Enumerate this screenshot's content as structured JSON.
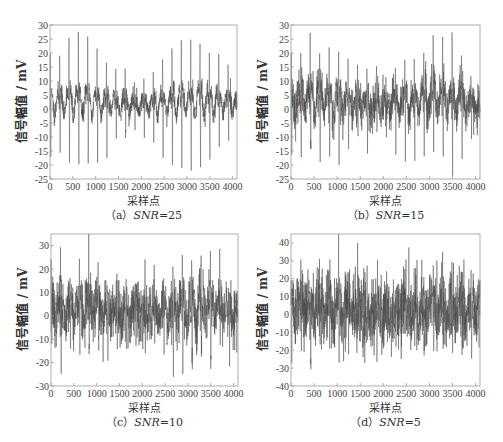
{
  "figure": {
    "ylabel": "信号幅值 / mV",
    "xlabel": "采样点",
    "line_color": "#4a4a4a",
    "axis_color": "#9a9a9a"
  },
  "panels": [
    {
      "id": "a",
      "caption_prefix": "（a）",
      "caption_var": "SNR",
      "caption_value": "=25",
      "box": {
        "left": 50,
        "top": 25,
        "right": 237,
        "bottom": 179
      },
      "ylim": [
        -25,
        30
      ],
      "yticks": [
        -25,
        -20,
        -15,
        -10,
        -5,
        0,
        5,
        10,
        15,
        20,
        25,
        30
      ],
      "noise_amp": 3,
      "seed": 11
    },
    {
      "id": "b",
      "caption_prefix": "（b）",
      "caption_var": "SNR",
      "caption_value": "=15",
      "box": {
        "left": 291,
        "top": 25,
        "right": 480,
        "bottom": 179
      },
      "ylim": [
        -25,
        30
      ],
      "yticks": [
        -25,
        -20,
        -15,
        -10,
        -5,
        0,
        5,
        10,
        15,
        20,
        25,
        30
      ],
      "noise_amp": 6,
      "seed": 23
    },
    {
      "id": "c",
      "caption_prefix": "（c）",
      "caption_var": "SNR",
      "caption_value": "=10",
      "box": {
        "left": 51,
        "top": 234,
        "right": 238,
        "bottom": 386
      },
      "ylim": [
        -30,
        35
      ],
      "yticks": [
        -30,
        -20,
        -10,
        0,
        10,
        20,
        30
      ],
      "noise_amp": 10,
      "seed": 37
    },
    {
      "id": "d",
      "caption_prefix": "（d）",
      "caption_var": "SNR",
      "caption_value": "=5",
      "box": {
        "left": 291,
        "top": 234,
        "right": 480,
        "bottom": 386
      },
      "ylim": [
        -40,
        45
      ],
      "yticks": [
        -40,
        -30,
        -20,
        -10,
        0,
        10,
        20,
        30,
        40
      ],
      "noise_amp": 17,
      "seed": 51
    }
  ],
  "chart_data": [
    {
      "type": "line",
      "title": "(a) SNR=25",
      "xlabel": "采样点",
      "ylabel": "信号幅值 / mV",
      "xlim": [
        0,
        4096
      ],
      "ylim": [
        -25,
        30
      ],
      "xticks": [
        0,
        500,
        1000,
        1500,
        2000,
        2500,
        3000,
        3500,
        4000
      ],
      "yticks": [
        -25,
        -20,
        -15,
        -10,
        -5,
        0,
        5,
        10,
        15,
        20,
        25,
        30
      ],
      "grid": false,
      "series": [
        {
          "name": "noisy ECG-like signal",
          "approx_range": [
            -21,
            27
          ],
          "peak_spacing_samples": 200
        }
      ]
    },
    {
      "type": "line",
      "title": "(b) SNR=15",
      "xlabel": "采样点",
      "ylabel": "信号幅值 / mV",
      "xlim": [
        0,
        4096
      ],
      "ylim": [
        -25,
        30
      ],
      "xticks": [
        0,
        500,
        1000,
        1500,
        2000,
        2500,
        3000,
        3500,
        4000
      ],
      "yticks": [
        -25,
        -20,
        -15,
        -10,
        -5,
        0,
        5,
        10,
        15,
        20,
        25,
        30
      ],
      "grid": false,
      "series": [
        {
          "name": "noisy ECG-like signal",
          "approx_range": [
            -22,
            28
          ],
          "peak_spacing_samples": 200
        }
      ]
    },
    {
      "type": "line",
      "title": "(c) SNR=10",
      "xlabel": "采样点",
      "ylabel": "信号幅值 / mV",
      "xlim": [
        0,
        4096
      ],
      "ylim": [
        -30,
        35
      ],
      "xticks": [
        0,
        500,
        1000,
        1500,
        2000,
        2500,
        3000,
        3500,
        4000
      ],
      "yticks": [
        -30,
        -20,
        -10,
        0,
        10,
        20,
        30
      ],
      "grid": false,
      "series": [
        {
          "name": "noisy ECG-like signal",
          "approx_range": [
            -30,
            35
          ],
          "peak_spacing_samples": 200
        }
      ]
    },
    {
      "type": "line",
      "title": "(d) SNR=5",
      "xlabel": "采样点",
      "ylabel": "信号幅值 / mV",
      "xlim": [
        0,
        4096
      ],
      "ylim": [
        -40,
        45
      ],
      "xticks": [
        0,
        500,
        1000,
        1500,
        2000,
        2500,
        3000,
        3500,
        4000
      ],
      "yticks": [
        -40,
        -30,
        -20,
        -10,
        0,
        10,
        20,
        30,
        40
      ],
      "grid": false,
      "series": [
        {
          "name": "noisy ECG-like signal",
          "approx_range": [
            -40,
            45
          ],
          "peak_spacing_samples": 200
        }
      ]
    }
  ],
  "xticks": [
    0,
    500,
    1000,
    1500,
    2000,
    2500,
    3000,
    3500,
    4000
  ],
  "xmax": 4096
}
